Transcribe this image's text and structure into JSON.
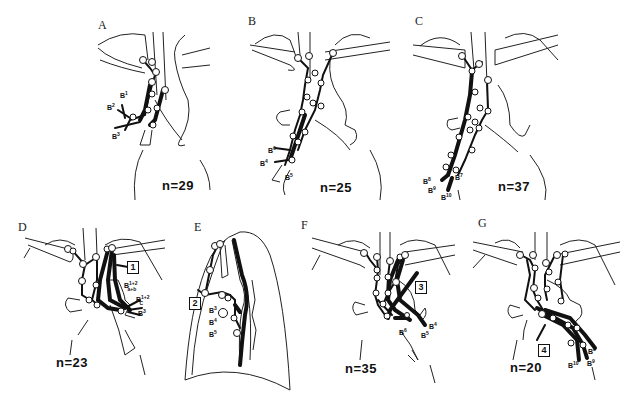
{
  "figure": {
    "panels": [
      {
        "id": "A",
        "label": "A",
        "n_text": "n=29",
        "n": 29,
        "bronchi": [
          "B1",
          "B2",
          "B3"
        ]
      },
      {
        "id": "B",
        "label": "B",
        "n_text": "n=25",
        "n": 25,
        "bronchi": [
          "B6",
          "B4",
          "B5"
        ]
      },
      {
        "id": "C",
        "label": "C",
        "n_text": "n=37",
        "n": 37,
        "bronchi": [
          "B7",
          "B8",
          "B9",
          "B10"
        ]
      },
      {
        "id": "D",
        "label": "D",
        "n_text": "n=23",
        "n": 23,
        "bronchi": [
          "B1+2 a+b",
          "Bc 1+2",
          "B3"
        ],
        "marker": "1"
      },
      {
        "id": "E",
        "label": "E",
        "n_text": "",
        "bronchi": [
          "B3",
          "B4",
          "B5"
        ],
        "marker": "2"
      },
      {
        "id": "F",
        "label": "F",
        "n_text": "n=35",
        "n": 35,
        "bronchi": [
          "B4",
          "B5",
          "B6"
        ],
        "marker": "3"
      },
      {
        "id": "G",
        "label": "G",
        "n_text": "n=20",
        "n": 20,
        "bronchi": [
          "B8",
          "B9",
          "B10"
        ],
        "marker": "4"
      }
    ]
  },
  "labels": {
    "A": {
      "b1": "B",
      "b1s": "1",
      "b2": "B",
      "b2s": "2",
      "b3": "B",
      "b3s": "3"
    },
    "B": {
      "b6": "B",
      "b6s": "6",
      "b4": "B",
      "b4s": "4",
      "b5": "B",
      "b5s": "5"
    },
    "C": {
      "b7": "B",
      "b7s": "7",
      "b8": "B",
      "b8s": "8",
      "b9": "B",
      "b9s": "9",
      "b10": "B",
      "b10s": "10"
    },
    "D": {
      "b12ab": "B",
      "b12ab_sup": "1+2",
      "b12ab_sub": "a+b",
      "b12c": "B",
      "b12c_sup": "1+2",
      "b12c_sub": "C",
      "b3": "B",
      "b3s": "3",
      "marker": "1"
    },
    "E": {
      "b3": "B",
      "b3s": "3",
      "b4": "B",
      "b4s": "4",
      "b5": "B",
      "b5s": "5",
      "marker": "2"
    },
    "F": {
      "b4": "B",
      "b4s": "4",
      "b5": "B",
      "b5s": "5",
      "b6": "B",
      "b6s": "6",
      "marker": "3"
    },
    "G": {
      "b8": "B",
      "b8s": "8",
      "b9": "B",
      "b9s": "9",
      "b10": "B",
      "b10s": "10",
      "marker": "4"
    }
  },
  "colors": {
    "ink": "#111111",
    "background": "#ffffff"
  }
}
